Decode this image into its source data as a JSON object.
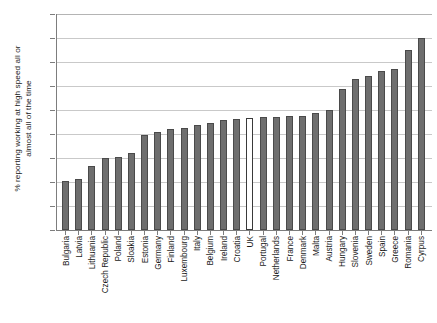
{
  "chart_data": {
    "type": "bar",
    "title": "",
    "subtitle": "",
    "xlabel": "",
    "ylabel": "% reporting working at high speed all or\nalmost all of the time",
    "ylim": [
      0,
      45
    ],
    "yticks": [
      0,
      5,
      10,
      15,
      20,
      25,
      30,
      35,
      40,
      45
    ],
    "grid": true,
    "legend": "none",
    "bar_color": "#6e6e6e",
    "highlight_color": "#ffffff",
    "highlight_category": "UK",
    "categories": [
      "Bulgaria",
      "Latvia",
      "Lithuania",
      "Czech Republic",
      "Poland",
      "Sloakia",
      "Estonia",
      "Germany",
      "Finland",
      "Luxembourg",
      "Italy",
      "Belgium",
      "Ireland",
      "Croatia",
      "UK",
      "Portugal",
      "Netherlands",
      "France",
      "Denmark",
      "Malta",
      "Austria",
      "Hungary",
      "Slovenia",
      "Sweden",
      "Spain",
      "Greece",
      "Romania",
      "Cyrpus"
    ],
    "values": [
      10.3,
      10.7,
      13.3,
      15.0,
      15.3,
      16.0,
      19.7,
      20.5,
      21.0,
      21.3,
      21.8,
      22.3,
      23.0,
      23.2,
      23.3,
      23.5,
      23.6,
      23.7,
      23.8,
      24.4,
      25.1,
      29.4,
      31.5,
      32.0,
      33.2,
      33.6,
      37.4,
      40.1
    ]
  }
}
